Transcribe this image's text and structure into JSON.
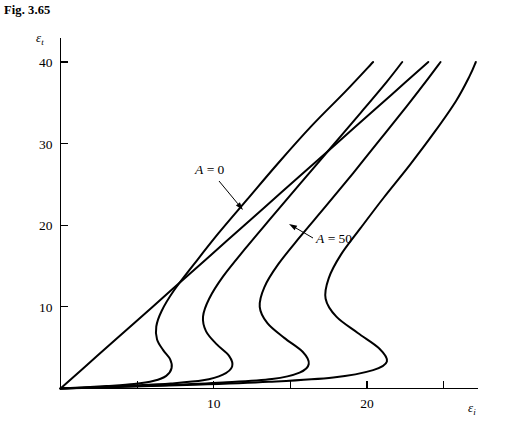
{
  "figure": {
    "caption": "Fig. 3.65"
  },
  "chart_data": {
    "type": "line",
    "title": "Fig. 3.65",
    "xlabel": "εi",
    "ylabel": "εt",
    "xlim": [
      0,
      26.5
    ],
    "ylim": [
      0,
      42
    ],
    "grid": false,
    "legend_position": "inline-annotations",
    "x_ticks": [
      5,
      10,
      15,
      20,
      25
    ],
    "x_tick_labels": [
      "",
      "10",
      "",
      "20",
      ""
    ],
    "y_ticks": [
      10,
      20,
      30,
      40
    ],
    "y_tick_labels": [
      "10",
      "20",
      "30",
      "40"
    ],
    "annotations": [
      {
        "name": "a-equals-0",
        "label_prefix": "A",
        "label_rest": " = 0",
        "text": "A = 0",
        "text_x": 195,
        "text_y": 174,
        "leader_from_x": 219,
        "leader_from_y": 181,
        "leader_to_x": 243,
        "leader_to_y": 210
      },
      {
        "name": "a-equals-50",
        "label_prefix": "A",
        "label_rest": " = 50",
        "text": "A = 50",
        "text_x": 316,
        "text_y": 243,
        "leader_from_x": 313,
        "leader_from_y": 238,
        "leader_to_x": 289,
        "leader_to_y": 224
      }
    ],
    "series": [
      {
        "name": "A = 0",
        "A": 0,
        "description": "straight diagonal line from origin to upper right",
        "points": [
          [
            0,
            0
          ],
          [
            2.4,
            4.0
          ],
          [
            4.8,
            8.0
          ],
          [
            7.2,
            12.0
          ],
          [
            9.6,
            16.0
          ],
          [
            12.0,
            20.0
          ],
          [
            14.4,
            24.0
          ],
          [
            16.8,
            28.0
          ],
          [
            19.2,
            32.0
          ],
          [
            21.6,
            36.0
          ],
          [
            24.0,
            40.0
          ]
        ]
      },
      {
        "name": "A = 12.5",
        "A": 12.5,
        "description": "S-shaped curve with nose near x=7.3",
        "points": [
          [
            0,
            0
          ],
          [
            1.4,
            0.12
          ],
          [
            3.0,
            0.3
          ],
          [
            4.8,
            0.55
          ],
          [
            6.1,
            0.95
          ],
          [
            6.9,
            1.55
          ],
          [
            7.25,
            2.5
          ],
          [
            7.15,
            3.6
          ],
          [
            6.7,
            4.7
          ],
          [
            6.3,
            6.0
          ],
          [
            6.25,
            7.6
          ],
          [
            6.6,
            9.5
          ],
          [
            7.4,
            12.0
          ],
          [
            8.7,
            15.2
          ],
          [
            10.3,
            19.0
          ],
          [
            12.2,
            23.2
          ],
          [
            14.2,
            27.6
          ],
          [
            16.4,
            32.2
          ],
          [
            18.6,
            36.4
          ],
          [
            20.4,
            40.0
          ]
        ]
      },
      {
        "name": "A = 25",
        "A": 25,
        "description": "S-shaped curve with nose near x=11.2",
        "points": [
          [
            0,
            0
          ],
          [
            2.2,
            0.15
          ],
          [
            4.6,
            0.35
          ],
          [
            7.2,
            0.62
          ],
          [
            9.3,
            1.0
          ],
          [
            10.6,
            1.7
          ],
          [
            11.2,
            2.7
          ],
          [
            11.0,
            4.0
          ],
          [
            10.2,
            5.4
          ],
          [
            9.5,
            7.0
          ],
          [
            9.3,
            8.8
          ],
          [
            9.7,
            11.0
          ],
          [
            10.6,
            13.7
          ],
          [
            12.0,
            17.0
          ],
          [
            13.7,
            20.8
          ],
          [
            15.6,
            25.0
          ],
          [
            17.6,
            29.4
          ],
          [
            19.6,
            33.8
          ],
          [
            21.3,
            37.6
          ],
          [
            22.3,
            40.0
          ]
        ]
      },
      {
        "name": "A = 37.5",
        "A": 37.5,
        "description": "S-shaped curve with nose near x=16.2",
        "points": [
          [
            0,
            0
          ],
          [
            3.2,
            0.18
          ],
          [
            6.8,
            0.4
          ],
          [
            10.6,
            0.72
          ],
          [
            13.8,
            1.15
          ],
          [
            15.6,
            1.95
          ],
          [
            16.2,
            3.0
          ],
          [
            15.8,
            4.5
          ],
          [
            14.6,
            6.2
          ],
          [
            13.5,
            8.0
          ],
          [
            13.0,
            10.0
          ],
          [
            13.3,
            12.4
          ],
          [
            14.2,
            15.2
          ],
          [
            15.6,
            18.5
          ],
          [
            17.3,
            22.3
          ],
          [
            19.1,
            26.4
          ],
          [
            20.9,
            30.6
          ],
          [
            22.6,
            34.6
          ],
          [
            24.0,
            38.0
          ],
          [
            24.8,
            40.0
          ]
        ]
      },
      {
        "name": "A = 50",
        "A": 50,
        "description": "S-shaped curve with nose near x=21.3, labeled A = 50",
        "points": [
          [
            0,
            0
          ],
          [
            4.2,
            0.2
          ],
          [
            8.8,
            0.45
          ],
          [
            13.6,
            0.82
          ],
          [
            17.8,
            1.35
          ],
          [
            20.4,
            2.25
          ],
          [
            21.3,
            3.3
          ],
          [
            20.8,
            4.9
          ],
          [
            19.4,
            6.8
          ],
          [
            18.0,
            8.8
          ],
          [
            17.3,
            11.0
          ],
          [
            17.5,
            13.5
          ],
          [
            18.3,
            16.4
          ],
          [
            19.6,
            19.7
          ],
          [
            21.1,
            23.4
          ],
          [
            22.8,
            27.4
          ],
          [
            24.4,
            31.4
          ],
          [
            25.8,
            35.2
          ],
          [
            26.7,
            38.3
          ],
          [
            27.1,
            40.0
          ]
        ]
      }
    ]
  },
  "axes": {
    "x_title": {
      "symbol": "ε",
      "subscript": "i"
    },
    "y_title": {
      "symbol": "ε",
      "subscript": "t"
    }
  }
}
